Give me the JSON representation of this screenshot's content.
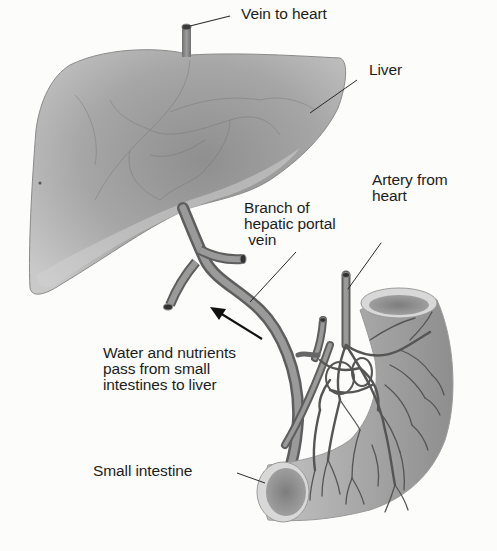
{
  "diagram": {
    "colors": {
      "background": "#fcfcfa",
      "organ_fill": "#a9a9a9",
      "organ_highlight": "#d6d6d6",
      "vessel_fill": "#8c8c8c",
      "vessel_edge": "#5a5a5a",
      "leader_line": "#2a2a2a",
      "text": "#1c1c1c"
    },
    "structures": [
      {
        "name": "liver",
        "label_key": "liver"
      },
      {
        "name": "vein-to-heart",
        "label_key": "vein_to_heart"
      },
      {
        "name": "hepatic-portal-vein-branch",
        "label_key": "branch_portal_vein"
      },
      {
        "name": "artery-from-heart",
        "label_key": "artery_from_heart"
      },
      {
        "name": "small-intestine",
        "label_key": "small_intestine"
      }
    ],
    "labels": {
      "vein_to_heart": "Vein to heart",
      "liver": "Liver",
      "artery_from_heart": "Artery from\nheart",
      "branch_portal_vein": "Branch of\nhepatic portal\n vein",
      "flow_note": "Water and nutrients\npass from small\nintestines to liver",
      "small_intestine": "Small intestine"
    },
    "arrows": [
      {
        "name": "nutrient-flow-arrow",
        "direction": "toward liver (up-left)"
      }
    ]
  }
}
